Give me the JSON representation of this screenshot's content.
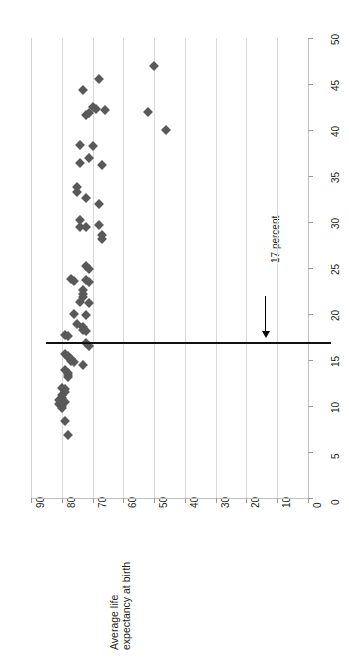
{
  "chart_data": {
    "type": "scatter",
    "title": "",
    "orientation": "rotated-90",
    "xlabel": "Average life expectancy at birth",
    "ylabel": "",
    "xlim": [
      0,
      90
    ],
    "ylim": [
      0,
      50
    ],
    "x_reversed": true,
    "grid": true,
    "legend": false,
    "marker": "diamond",
    "marker_color": "#595959",
    "gridline_color": "#d9d9d9",
    "axis_color": "#bfbfbf",
    "x_ticks": [
      90,
      80,
      70,
      60,
      50,
      40,
      30,
      20,
      10,
      0
    ],
    "y_ticks": [
      0,
      5,
      10,
      15,
      20,
      25,
      30,
      35,
      40,
      45,
      50
    ],
    "x_tick_labels": [
      "90",
      "80",
      "70",
      "60",
      "50",
      "40",
      "30",
      "20",
      "10",
      "0"
    ],
    "y_tick_labels": [
      "0",
      "5",
      "10",
      "15",
      "20",
      "25",
      "30",
      "35",
      "40",
      "45",
      "50"
    ],
    "reference_line": {
      "value": 17,
      "axis": "y",
      "label": "17 percent",
      "color": "#111111"
    },
    "annotations": [
      {
        "text": "17 percent",
        "points_to": 17
      }
    ],
    "points": [
      {
        "life": 50,
        "pct": 47.0
      },
      {
        "life": 52,
        "pct": 42.0
      },
      {
        "life": 46,
        "pct": 40.0
      },
      {
        "life": 68,
        "pct": 45.5
      },
      {
        "life": 73,
        "pct": 44.3
      },
      {
        "life": 70,
        "pct": 42.5
      },
      {
        "life": 69,
        "pct": 42.3
      },
      {
        "life": 66,
        "pct": 42.2
      },
      {
        "life": 71,
        "pct": 41.8
      },
      {
        "life": 72,
        "pct": 41.6
      },
      {
        "life": 74,
        "pct": 38.4
      },
      {
        "life": 70,
        "pct": 38.3
      },
      {
        "life": 71,
        "pct": 37.0
      },
      {
        "life": 74,
        "pct": 36.4
      },
      {
        "life": 67,
        "pct": 36.2
      },
      {
        "life": 75,
        "pct": 33.8
      },
      {
        "life": 75,
        "pct": 33.3
      },
      {
        "life": 72,
        "pct": 32.6
      },
      {
        "life": 68,
        "pct": 32.0
      },
      {
        "life": 74,
        "pct": 30.2
      },
      {
        "life": 74,
        "pct": 29.5
      },
      {
        "life": 72,
        "pct": 29.5
      },
      {
        "life": 68,
        "pct": 29.7
      },
      {
        "life": 67,
        "pct": 28.6
      },
      {
        "life": 67,
        "pct": 28.2
      },
      {
        "life": 72,
        "pct": 25.2
      },
      {
        "life": 71,
        "pct": 24.9
      },
      {
        "life": 77,
        "pct": 23.8
      },
      {
        "life": 76,
        "pct": 23.6
      },
      {
        "life": 72,
        "pct": 23.7
      },
      {
        "life": 71,
        "pct": 23.5
      },
      {
        "life": 73,
        "pct": 22.6
      },
      {
        "life": 73,
        "pct": 22.2
      },
      {
        "life": 73,
        "pct": 21.9
      },
      {
        "life": 74,
        "pct": 21.3
      },
      {
        "life": 71,
        "pct": 21.2
      },
      {
        "life": 76,
        "pct": 20.0
      },
      {
        "life": 72,
        "pct": 19.9
      },
      {
        "life": 75,
        "pct": 18.9
      },
      {
        "life": 73,
        "pct": 18.6
      },
      {
        "life": 73,
        "pct": 18.3
      },
      {
        "life": 72,
        "pct": 18.1
      },
      {
        "life": 79,
        "pct": 17.7
      },
      {
        "life": 78,
        "pct": 17.6
      },
      {
        "life": 72,
        "pct": 16.8
      },
      {
        "life": 71,
        "pct": 16.5
      },
      {
        "life": 79,
        "pct": 15.6
      },
      {
        "life": 78,
        "pct": 15.4
      },
      {
        "life": 78,
        "pct": 15.3
      },
      {
        "life": 77,
        "pct": 15.1
      },
      {
        "life": 77,
        "pct": 14.9
      },
      {
        "life": 76,
        "pct": 14.8
      },
      {
        "life": 73,
        "pct": 14.5
      },
      {
        "life": 79,
        "pct": 13.9
      },
      {
        "life": 78,
        "pct": 13.6
      },
      {
        "life": 78,
        "pct": 13.4
      },
      {
        "life": 78,
        "pct": 13.1
      },
      {
        "life": 80,
        "pct": 12.0
      },
      {
        "life": 79,
        "pct": 11.8
      },
      {
        "life": 79,
        "pct": 11.5
      },
      {
        "life": 80,
        "pct": 11.2
      },
      {
        "life": 80,
        "pct": 10.9
      },
      {
        "life": 81,
        "pct": 10.7
      },
      {
        "life": 80,
        "pct": 10.5
      },
      {
        "life": 79,
        "pct": 10.4
      },
      {
        "life": 81,
        "pct": 10.2
      },
      {
        "life": 80,
        "pct": 10.0
      },
      {
        "life": 80,
        "pct": 9.8
      },
      {
        "life": 79,
        "pct": 8.4
      },
      {
        "life": 78,
        "pct": 6.9
      }
    ]
  },
  "axis": {
    "x_title": "Average life expectancy at birth",
    "x_title_line1": "Average life",
    "x_title_line2": "expectancy at birth"
  }
}
